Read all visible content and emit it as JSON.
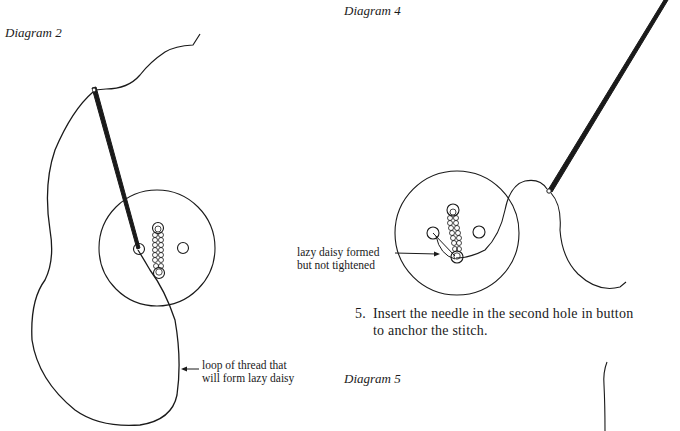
{
  "diagram2": {
    "caption": "Diagram 2",
    "callout_line1": "loop of thread that",
    "callout_line2": "will form lazy daisy"
  },
  "diagram4": {
    "caption": "Diagram 4",
    "callout_line1": "lazy daisy formed",
    "callout_line2": "but not tightened"
  },
  "step5": {
    "number": "5.",
    "line1": "Insert the needle in the second hole in button",
    "line2": "to anchor the stitch."
  },
  "diagram5": {
    "caption": "Diagram 5"
  }
}
